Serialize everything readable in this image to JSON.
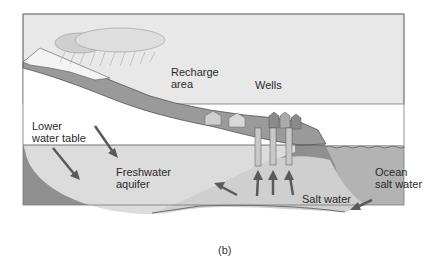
{
  "labels": {
    "recharge_area": "Recharge\narea",
    "wells": "Wells",
    "lower_water_table": "Lower\nwater table",
    "freshwater_aquifer": "Freshwater\naquifer",
    "ocean_salt_water": "Ocean\nsalt water",
    "salt_water": "Salt water"
  },
  "caption": "(b)",
  "colors": {
    "sky": "#e6e6e6",
    "land": "#9a9a9a",
    "bedrock": "#8c8c8c",
    "freshwater": "#dcdcdc",
    "saltwater_wedge": "#cfcfcf",
    "ocean": "#b4b4b4",
    "cloud": "#d0d0d0",
    "arrow": "#5a5a5a",
    "well_pipe": "#c8c8c8",
    "text": "#2a2a2a"
  }
}
